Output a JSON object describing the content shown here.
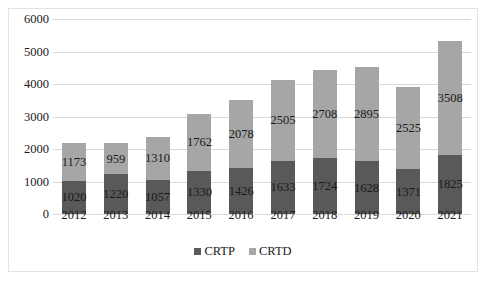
{
  "chart_data": {
    "type": "bar",
    "stacked": true,
    "title": "",
    "xlabel": "",
    "ylabel": "",
    "ylim": [
      0,
      6000
    ],
    "ytick_step": 1000,
    "yticks": [
      "0",
      "1000",
      "2000",
      "3000",
      "4000",
      "5000",
      "6000"
    ],
    "grid": true,
    "legend_position": "bottom",
    "categories": [
      "2012",
      "2013",
      "2014",
      "2015",
      "2016",
      "2017",
      "2018",
      "2019",
      "2020",
      "2021"
    ],
    "series": [
      {
        "name": "CRTP",
        "color": "#595959",
        "values": [
          1020,
          1220,
          1057,
          1330,
          1426,
          1633,
          1724,
          1628,
          1371,
          1825
        ]
      },
      {
        "name": "CRTD",
        "color": "#a6a6a6",
        "values": [
          1173,
          959,
          1310,
          1762,
          2078,
          2505,
          2708,
          2895,
          2525,
          3508
        ]
      }
    ],
    "totals": [
      2193,
      2179,
      2367,
      3092,
      3504,
      4138,
      4432,
      4523,
      3896,
      5333
    ]
  },
  "colors": {
    "series_crtp": "#595959",
    "series_crtd": "#a6a6a6",
    "gridline": "#d9d9d9",
    "frame_border": "#e2e2e2",
    "text": "#202020",
    "background": "#ffffff"
  }
}
